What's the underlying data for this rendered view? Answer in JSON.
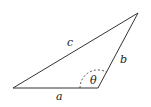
{
  "diagram": {
    "type": "triangle",
    "colors": {
      "stroke": "#333333",
      "text": "#222222",
      "background": "#ffffff"
    },
    "vertices": {
      "left": [
        13,
        88
      ],
      "bottom_right": [
        98,
        88
      ],
      "top": [
        138,
        13
      ]
    },
    "sides": {
      "a": {
        "label": "a",
        "between": [
          "left",
          "bottom_right"
        ]
      },
      "b": {
        "label": "b",
        "between": [
          "bottom_right",
          "top"
        ]
      },
      "c": {
        "label": "c",
        "between": [
          "left",
          "top"
        ]
      }
    },
    "angle": {
      "label": "θ",
      "at": "bottom_right",
      "style": "dashed-arc"
    }
  }
}
